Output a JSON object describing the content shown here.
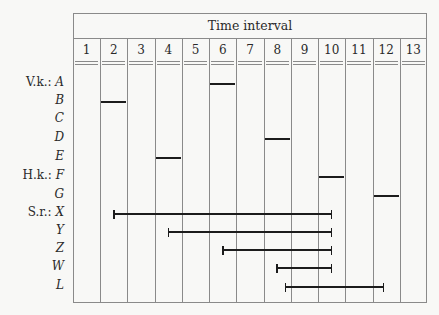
{
  "chart_data": {
    "type": "gantt",
    "title": "Time interval",
    "xlabel": "Time interval",
    "categories": [
      "1",
      "2",
      "3",
      "4",
      "5",
      "6",
      "7",
      "8",
      "9",
      "10",
      "11",
      "12",
      "13"
    ],
    "groups": [
      {
        "prefix": "V.k.:",
        "rows": [
          "A",
          "B",
          "C",
          "D",
          "E"
        ]
      },
      {
        "prefix": "H.k.:",
        "rows": [
          "F",
          "G"
        ]
      },
      {
        "prefix": "S.r.:",
        "rows": [
          "X",
          "Y",
          "Z",
          "W",
          "L"
        ]
      }
    ],
    "rows": [
      {
        "label": "A",
        "prefix": "V.k.:",
        "type": "cell",
        "interval": [
          6,
          6
        ]
      },
      {
        "label": "B",
        "prefix": "",
        "type": "cell",
        "interval": [
          2,
          2
        ]
      },
      {
        "label": "C",
        "prefix": "",
        "type": "none",
        "interval": null
      },
      {
        "label": "D",
        "prefix": "",
        "type": "cell",
        "interval": [
          8,
          8
        ]
      },
      {
        "label": "E",
        "prefix": "",
        "type": "cell",
        "interval": [
          4,
          4
        ]
      },
      {
        "label": "F",
        "prefix": "H.k.:",
        "type": "cell",
        "interval": [
          10,
          10
        ]
      },
      {
        "label": "G",
        "prefix": "",
        "type": "cell",
        "interval": [
          12,
          12
        ]
      },
      {
        "label": "X",
        "prefix": "S.r.:",
        "type": "range",
        "interval": [
          2.5,
          10.5
        ]
      },
      {
        "label": "Y",
        "prefix": "",
        "type": "range",
        "interval": [
          4.5,
          10.5
        ]
      },
      {
        "label": "Z",
        "prefix": "",
        "type": "range",
        "interval": [
          6.5,
          10.5
        ]
      },
      {
        "label": "W",
        "prefix": "",
        "type": "range",
        "interval": [
          8.5,
          10.5
        ]
      },
      {
        "label": "L",
        "prefix": "",
        "type": "range",
        "interval": [
          8.8,
          12.4
        ]
      }
    ],
    "grid": true,
    "legend": null
  }
}
